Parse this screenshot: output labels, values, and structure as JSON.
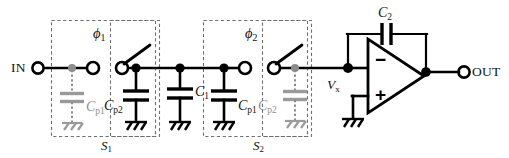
{
  "figure": {
    "kind": "schematic",
    "width": 509,
    "height": 158,
    "background": "#ffffff",
    "ink": "#000000",
    "gray_ink": "#8c8c8c",
    "dash_color": "#6e6e6e"
  },
  "terminals": {
    "input_label": "IN",
    "output_label": "OUT",
    "node_vx_symbol": "V",
    "node_vx_subscript": "x"
  },
  "switch_blocks": [
    {
      "name": "S1",
      "block_label_symbol": "S",
      "block_label_subscript": "1",
      "clock_symbol": "ϕ",
      "clock_subscript": "1"
    },
    {
      "name": "S2",
      "block_label_symbol": "S",
      "block_label_subscript": "2",
      "clock_symbol": "ϕ",
      "clock_subscript": "2"
    }
  ],
  "capacitors": [
    {
      "id": "cp1-a",
      "symbol": "C",
      "subscript": "p1",
      "style": "dotted-gray",
      "group": "S1-left"
    },
    {
      "id": "cp2-a",
      "symbol": "C",
      "subscript": "p2",
      "style": "solid",
      "group": "S1-right"
    },
    {
      "id": "c1",
      "symbol": "C",
      "subscript": "1",
      "style": "solid",
      "group": "main"
    },
    {
      "id": "cp1-b",
      "symbol": "C",
      "subscript": "p1",
      "style": "solid",
      "group": "S2-left"
    },
    {
      "id": "cp2-b",
      "symbol": "C",
      "subscript": "p2",
      "style": "dotted-gray",
      "group": "S2-right"
    },
    {
      "id": "c2",
      "symbol": "C",
      "subscript": "2",
      "style": "solid",
      "group": "feedback"
    }
  ],
  "opamp": {
    "inverting_input_label": "−",
    "noninverting_input_label": "+",
    "noninverting_tied_to": "ground"
  },
  "ground_symbols_count": 6
}
